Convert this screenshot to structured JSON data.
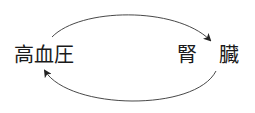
{
  "diagram": {
    "nodes": [
      {
        "id": "hypertension",
        "label": "高血圧"
      },
      {
        "id": "kidney",
        "label_parts": [
          "腎",
          "臓"
        ]
      }
    ],
    "edges": [
      {
        "from": "hypertension",
        "to": "kidney",
        "style": "curved-arrow-top"
      },
      {
        "from": "kidney",
        "to": "hypertension",
        "style": "curved-arrow-bottom"
      }
    ],
    "colors": {
      "stroke": "#333333",
      "text": "#1a1a1a",
      "background": "#ffffff"
    }
  }
}
